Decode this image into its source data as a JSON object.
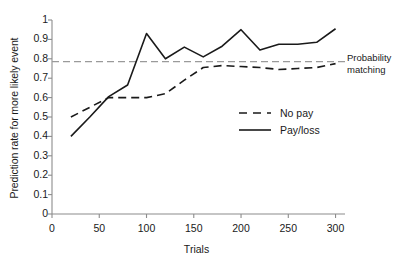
{
  "chart_data": {
    "type": "line",
    "title": "",
    "xlabel": "Trials",
    "ylabel": "Prediction rate for more likely event",
    "xlim": [
      0,
      310
    ],
    "ylim": [
      0,
      1
    ],
    "grid": false,
    "legend_position": "inside-right",
    "xticks": [
      0,
      50,
      100,
      150,
      200,
      250,
      300
    ],
    "yticks": [
      "0",
      "0.1",
      "0.2",
      "0.3",
      "0.4",
      "0.5",
      "0.6",
      "0.7",
      "0.8",
      "0.9",
      "1"
    ],
    "series": [
      {
        "name": "No pay",
        "style": "dashed",
        "color": "#1a1a1a",
        "x": [
          20,
          40,
          60,
          80,
          100,
          120,
          140,
          160,
          180,
          200,
          220,
          240,
          260,
          280,
          300
        ],
        "values": [
          0.5,
          0.55,
          0.6,
          0.6,
          0.6,
          0.62,
          0.69,
          0.755,
          0.765,
          0.76,
          0.755,
          0.745,
          0.75,
          0.755,
          0.775
        ]
      },
      {
        "name": "Pay/loss",
        "style": "solid",
        "color": "#1a1a1a",
        "x": [
          20,
          40,
          60,
          80,
          100,
          120,
          140,
          160,
          180,
          200,
          220,
          240,
          260,
          280,
          300
        ],
        "values": [
          0.4,
          0.5,
          0.605,
          0.665,
          0.93,
          0.8,
          0.86,
          0.81,
          0.865,
          0.95,
          0.845,
          0.875,
          0.875,
          0.885,
          0.955
        ]
      }
    ],
    "reference_lines": [
      {
        "name": "Probability matching",
        "label": "Probability matching",
        "value": 0.785,
        "style": "dashed",
        "color": "#9a9a9a",
        "x_start": 52,
        "x_end": 345
      }
    ],
    "axis_color": "#8c8c8c"
  },
  "legend": {
    "items": [
      {
        "label": "No pay",
        "style": "dashed"
      },
      {
        "label": "Pay/loss",
        "style": "solid"
      }
    ]
  },
  "labels": {
    "ylabel": "Prediction rate for more likely event",
    "xlabel": "Trials",
    "reference_line_1": "Probability",
    "reference_line_2": "matching"
  }
}
